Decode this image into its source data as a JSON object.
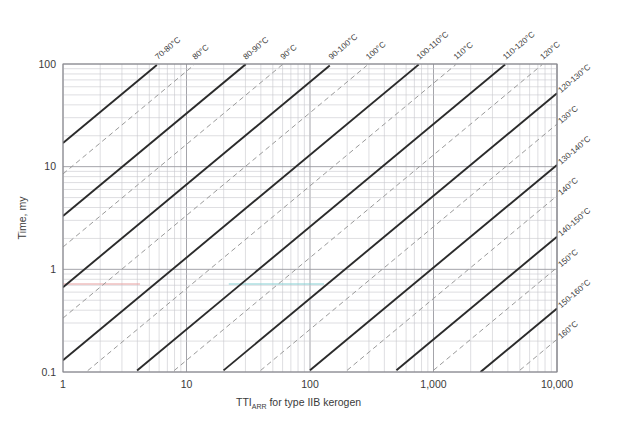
{
  "chart_data": {
    "type": "line",
    "title": "",
    "xlabel": "TTI_ARR for type IIB kerogen",
    "xlabel_main": "TTI",
    "xlabel_sub": "ARR",
    "xlabel_rest": " for type IIB kerogen",
    "ylabel": "Time, my",
    "xscale": "log",
    "yscale": "log",
    "xlim": [
      1,
      10000
    ],
    "ylim": [
      0.1,
      100
    ],
    "xticks": [
      "1",
      "10",
      "100",
      "1,000",
      "10,000"
    ],
    "xtick_values": [
      1,
      10,
      100,
      1000,
      10000
    ],
    "yticks": [
      "0.1",
      "1",
      "10",
      "100"
    ],
    "ytick_values": [
      0.1,
      1,
      10,
      100
    ],
    "grid": "log-minor-both-axes",
    "legend": "none",
    "annotations": "Diagonal isotherm lines labelled along top and right edges; solid black lines denote temperature intervals, dashed grey lines denote single temperatures.",
    "series": [
      {
        "name": "70-80°C",
        "style": "solid",
        "label_edge": "top",
        "y_at_x1": 17.0
      },
      {
        "name": "80°C",
        "style": "dashed",
        "label_edge": "top",
        "y_at_x1": 8.5
      },
      {
        "name": "80-90°C",
        "style": "solid",
        "label_edge": "top",
        "y_at_x1": 3.3
      },
      {
        "name": "90°C",
        "style": "dashed",
        "label_edge": "top",
        "y_at_x1": 1.65
      },
      {
        "name": "90-100°C",
        "style": "solid",
        "label_edge": "top",
        "y_at_x1": 0.67
      },
      {
        "name": "100°C",
        "style": "dashed",
        "label_edge": "top",
        "y_at_x1": 0.335
      },
      {
        "name": "100-110°C",
        "style": "solid",
        "label_edge": "top",
        "y_at_x1": 0.13
      },
      {
        "name": "110°C",
        "style": "dashed",
        "label_edge": "top",
        "y_at_x1": 0.065
      },
      {
        "name": "110-120°C",
        "style": "solid",
        "label_edge": "top",
        "y_at_x1": 0.026
      },
      {
        "name": "120°C",
        "style": "dashed",
        "label_edge": "top",
        "y_at_x1": 0.013
      },
      {
        "name": "120-130°C",
        "style": "solid",
        "label_edge": "right",
        "y_at_x1": 0.0052
      },
      {
        "name": "130°C",
        "style": "dashed",
        "label_edge": "right",
        "y_at_x1": 0.0026
      },
      {
        "name": "130-140°C",
        "style": "solid",
        "label_edge": "right",
        "y_at_x1": 0.00104
      },
      {
        "name": "140°C",
        "style": "dashed",
        "label_edge": "right",
        "y_at_x1": 0.00052
      },
      {
        "name": "140-150°C",
        "style": "solid",
        "label_edge": "right",
        "y_at_x1": 0.000208
      },
      {
        "name": "150°C",
        "style": "dashed",
        "label_edge": "right",
        "y_at_x1": 0.000104
      },
      {
        "name": "150-160°C",
        "style": "solid",
        "label_edge": "right",
        "y_at_x1": 4.16e-05
      },
      {
        "name": "160°C",
        "style": "dashed",
        "label_edge": "right",
        "y_at_x1": 2.08e-05
      },
      {
        "name": "160-170°C",
        "style": "solid",
        "label_edge": "right",
        "y_at_x1": 8.3e-06
      }
    ],
    "highlight_lines": [
      {
        "name": "red-marker",
        "orientation": "horizontal",
        "y": 0.72,
        "x_from": 1,
        "x_to": 4.2,
        "color": "#e8a0a0"
      },
      {
        "name": "cyan-marker",
        "orientation": "horizontal",
        "y": 0.72,
        "x_from": 22,
        "x_to": 130,
        "color": "#86cfd4"
      }
    ],
    "colors": {
      "solid_line": "#2b2b2b",
      "dashed_line": "#9a9a9a",
      "grid_major": "#9a9aa0",
      "grid_minor": "#c8c8cc",
      "axis": "#8a8a90",
      "text": "#3a3a3a",
      "background": "#ffffff"
    }
  }
}
